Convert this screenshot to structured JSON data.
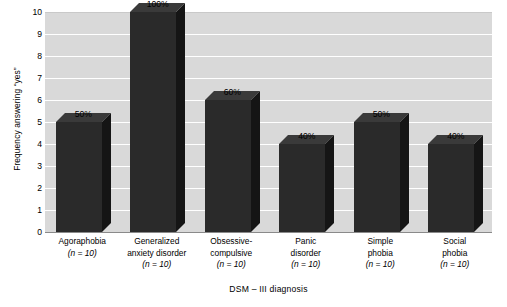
{
  "chart_data": {
    "type": "bar",
    "title": "",
    "subtitle": "",
    "xlabel": "DSM – III diagnosis",
    "ylabel": "Frequency answering “yes”",
    "ylim": [
      0,
      10
    ],
    "yticks": [
      "10",
      "9",
      "8",
      "7",
      "6",
      "5",
      "4",
      "3",
      "2",
      "1",
      "0"
    ],
    "grid": true,
    "legend": "none",
    "categories": [
      "Agoraphobia",
      "Generalized anxiety disorder",
      "Obsessive-compulsive",
      "Panic disorder",
      "Simple phobia",
      "Social phobia"
    ],
    "category_lines": [
      [
        "Agoraphobia"
      ],
      [
        "Generalized",
        "anxiety disorder"
      ],
      [
        "Obsessive-",
        "compulsive"
      ],
      [
        "Panic",
        "disorder"
      ],
      [
        "Simple",
        "phobia"
      ],
      [
        "Social",
        "phobia"
      ]
    ],
    "group_sizes": [
      "(n = 10)",
      "(n = 10)",
      "(n = 10)",
      "(n = 10)",
      "(n = 10)",
      "(n = 10)"
    ],
    "values": [
      5,
      10,
      6,
      4,
      5,
      4
    ],
    "data_labels": [
      "50%",
      "100%",
      "60%",
      "40%",
      "50%",
      "40%"
    ],
    "colors": {
      "bar_front": "#2a2a2a",
      "bar_side": "#151515",
      "bar_top": "#3a3a3a",
      "plot_background": "#d9d9d9",
      "gridline": "#ffffff",
      "axis": "#8a8a8a",
      "text": "#000000",
      "page_background": "#ffffff"
    }
  }
}
